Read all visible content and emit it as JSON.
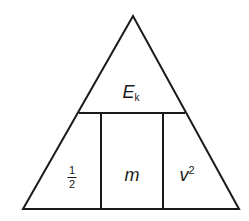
{
  "diagram": {
    "stroke_color": "#1a1a1a",
    "top": {
      "symbol": "E",
      "subscript": "k"
    },
    "bottom": [
      {
        "numerator": "1",
        "denominator": "2"
      },
      {
        "symbol": "m"
      },
      {
        "symbol": "v",
        "superscript": "2"
      }
    ]
  }
}
